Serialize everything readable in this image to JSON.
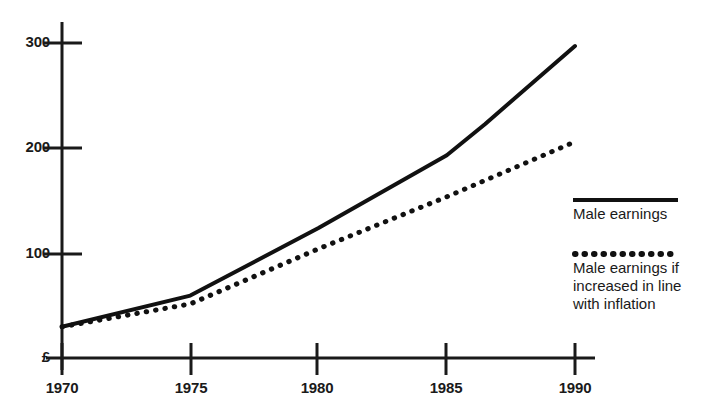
{
  "chart_data": {
    "type": "line",
    "title": "",
    "subtitle": "",
    "xlabel": "",
    "ylabel": "£",
    "currency_symbol": "£",
    "x": [
      1970,
      1975,
      1980,
      1985,
      1990
    ],
    "xlim": [
      1969,
      1990.5
    ],
    "ylim": [
      0,
      320
    ],
    "xticks": [
      "1970",
      "1975",
      "1980",
      "1985",
      "1990"
    ],
    "yticks": [
      "100",
      "200",
      "300"
    ],
    "ytick_values": [
      100,
      200,
      300
    ],
    "grid": false,
    "legend_position": "right",
    "series": [
      {
        "name": "Male earnings",
        "style": "solid",
        "color": "#111111",
        "points": [
          [
            1970,
            30
          ],
          [
            1975,
            60
          ],
          [
            1980,
            125
          ],
          [
            1985,
            195
          ],
          [
            1986.5,
            225
          ],
          [
            1990,
            300
          ]
        ],
        "values": [
          30,
          60,
          125,
          195,
          300
        ]
      },
      {
        "name": "Male earnings if increased in line with inflation",
        "style": "dotted",
        "color": "#111111",
        "points": [
          [
            1970,
            30
          ],
          [
            1975,
            52
          ],
          [
            1980,
            105
          ],
          [
            1985,
            155
          ],
          [
            1990,
            208
          ]
        ],
        "values": [
          30,
          52,
          105,
          155,
          208
        ]
      }
    ]
  },
  "axes": {
    "y_origin_label": "£",
    "ytick_labels": [
      "300",
      "200",
      "100"
    ],
    "xtick_labels": [
      "1970",
      "1975",
      "1980",
      "1985",
      "1990"
    ]
  },
  "legend": {
    "entries": [
      {
        "swatch": "solid-line-swatch",
        "lines": [
          "Male earnings"
        ]
      },
      {
        "swatch": "dotted-line-swatch",
        "lines": [
          "Male earnings if",
          "increased in line",
          "with inflation"
        ]
      }
    ]
  }
}
